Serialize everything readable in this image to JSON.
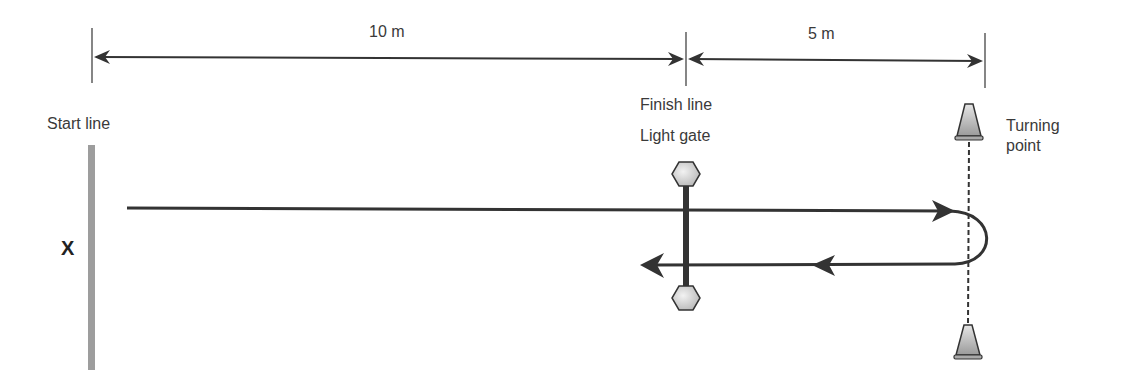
{
  "diagram": {
    "dimensions": [
      {
        "label": "10 m",
        "from": "start line",
        "to": "finish line"
      },
      {
        "label": "5 m",
        "from": "finish line",
        "to": "turning point"
      }
    ],
    "labels": {
      "start_line": "Start line",
      "finish_line": "Finish line",
      "light_gate": "Light gate",
      "turning_point_line1": "Turning",
      "turning_point_line2": "point",
      "start_marker": "X"
    },
    "colors": {
      "line": "#333333",
      "start_bar": "#999999",
      "cone_fill": "#bbbbbb",
      "hexagon_fill": "#d9d9d9"
    }
  }
}
